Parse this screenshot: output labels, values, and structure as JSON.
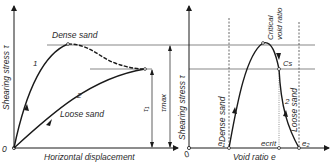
{
  "figure": {
    "left_panel": {
      "y_axis_label": "Shearing stress τ",
      "x_axis_label": "Horizontal displacement",
      "origin_label": "0",
      "curve_1_label": "1",
      "curve_2_label": "2",
      "dense_label": "Dense sand",
      "loose_label": "Loose sand",
      "tau_1_label": "τ₁",
      "tau_max_label": "τmax"
    },
    "right_panel": {
      "y_axis_label": "Shearing stress τ",
      "x_axis_label": "Void ratio  e",
      "origin_label": "0",
      "critical_label_line1": "Critical",
      "critical_label_line2": "void ratio",
      "cs_label": "Cs",
      "dense_label": "Dense sand",
      "loose_label": "Loose sand",
      "curve_1_label": "1",
      "curve_2_label": "2",
      "e1_label": "e₁",
      "ecrit_label": "ecrit",
      "e2_label": "e₂"
    },
    "colors": {
      "line": "#1a1a1a",
      "guide": "#555555",
      "background": "#ffffff"
    }
  }
}
